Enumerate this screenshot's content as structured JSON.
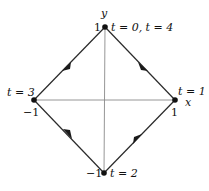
{
  "diagram": {
    "type": "parametric-path-diamond",
    "axes": {
      "x_label": "x",
      "y_label": "y",
      "axis_color": "#8a8a8a"
    },
    "path_color": "#2a2a2a",
    "vertices": [
      {
        "id": "top",
        "px": [
          105,
          27
        ],
        "coord": [
          0,
          1
        ],
        "value_label": "1",
        "time_label": "t = 0, t = 4"
      },
      {
        "id": "right",
        "px": [
          175,
          100
        ],
        "coord": [
          1,
          0
        ],
        "value_label": "1",
        "time_label": "t = 1"
      },
      {
        "id": "bottom",
        "px": [
          104,
          173
        ],
        "coord": [
          0,
          -1
        ],
        "value_label": "−1",
        "time_label": "t = 2"
      },
      {
        "id": "left",
        "px": [
          34,
          100
        ],
        "coord": [
          -1,
          0
        ],
        "value_label": "−1",
        "time_label": "t = 3"
      }
    ],
    "edges": [
      {
        "from": "top",
        "to": "right",
        "direction": "clockwise"
      },
      {
        "from": "right",
        "to": "bottom",
        "direction": "clockwise"
      },
      {
        "from": "bottom",
        "to": "left",
        "direction": "clockwise"
      },
      {
        "from": "left",
        "to": "top",
        "direction": "clockwise"
      }
    ]
  }
}
